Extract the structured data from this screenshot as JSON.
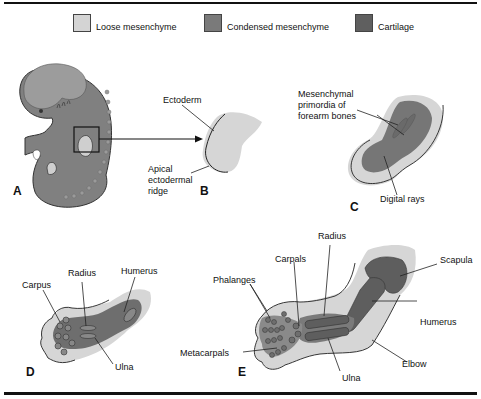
{
  "legend": {
    "items": [
      {
        "label": "Loose mesenchyme",
        "color": "#d4d4d4"
      },
      {
        "label": "Condensed mesenchyme",
        "color": "#7a7a7a"
      },
      {
        "label": "Cartilage",
        "color": "#5f5f5f"
      }
    ]
  },
  "colors": {
    "loose": "#d6d6d6",
    "embryo": "#808080",
    "condensed": "#767676",
    "cartilage": "#5e5e5e",
    "outline": "#222222"
  },
  "panels": {
    "A": {
      "letter": "A"
    },
    "B": {
      "letter": "B",
      "labels": {
        "ectoderm": "Ectoderm",
        "aer_1": "Apical",
        "aer_2": "ectodermal",
        "aer_3": "ridge"
      }
    },
    "C": {
      "letter": "C",
      "labels": {
        "prim_1": "Mesenchymal",
        "prim_2": "primordia of",
        "prim_3": "forearm bones",
        "digital": "Digital rays"
      }
    },
    "D": {
      "letter": "D",
      "labels": {
        "carpus": "Carpus",
        "radius": "Radius",
        "humerus": "Humerus",
        "ulna": "Ulna"
      }
    },
    "E": {
      "letter": "E",
      "labels": {
        "radius": "Radius",
        "carpals": "Carpals",
        "phalanges": "Phalanges",
        "scapula": "Scapula",
        "humerus": "Humerus",
        "metacarpals": "Metacarpals",
        "elbow": "Elbow",
        "ulna": "Ulna"
      }
    }
  }
}
